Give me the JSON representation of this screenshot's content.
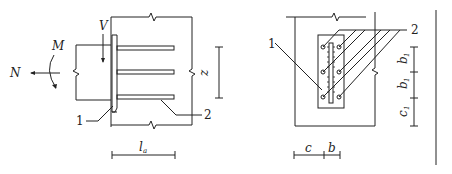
{
  "figure": {
    "type": "structural-connection-detail",
    "left_view": {
      "name": "side-elevation",
      "labels": {
        "moment": "M",
        "axial": "N",
        "shear": "V",
        "lever_arm": "z",
        "anchor_length": "l",
        "anchor_length_sub": "a",
        "callout_1": "1",
        "callout_2": "2"
      },
      "anchor_rows": 3
    },
    "right_view": {
      "name": "front-elevation",
      "labels": {
        "callout_1": "1",
        "callout_2": "2",
        "spacing_b1_top": "b",
        "spacing_b1_top_sub": "1",
        "spacing_b1_mid": "b",
        "spacing_b1_mid_sub": "1",
        "edge_c1": "c",
        "edge_c1_sub": "1",
        "edge_c": "c",
        "spacing_b": "b"
      },
      "anchor_rows": 3,
      "anchor_cols": 2
    },
    "colors": {
      "line": "#222222",
      "background": "#ffffff"
    }
  }
}
